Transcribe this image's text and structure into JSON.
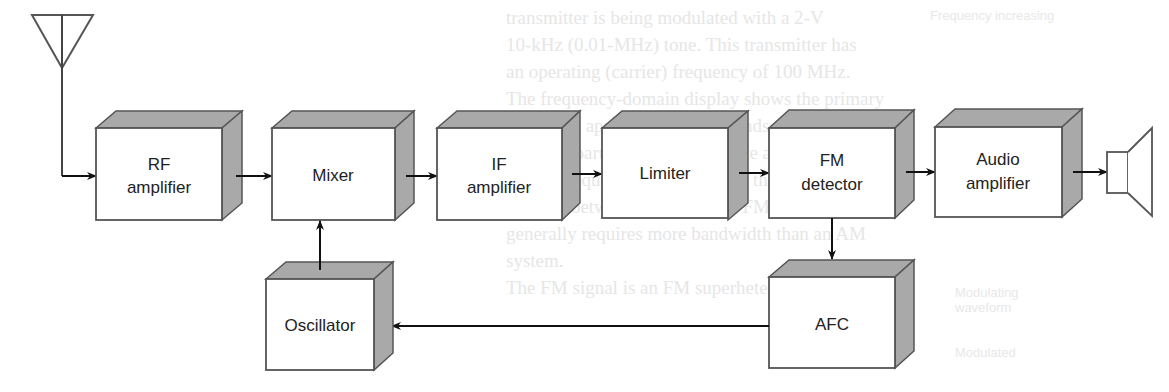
{
  "diagram": {
    "colors": {
      "box_face": "#ffffff",
      "box_shade": "#a9a9a9",
      "stroke": "#555555",
      "arrow": "#111111",
      "ghost_text": "#e6e6e6"
    },
    "blocks": [
      {
        "id": "rf",
        "line1": "RF",
        "line2": "amplifier"
      },
      {
        "id": "mix",
        "line1": "Mixer",
        "line2": ""
      },
      {
        "id": "if",
        "line1": "IF",
        "line2": "amplifier"
      },
      {
        "id": "lim",
        "line1": "Limiter",
        "line2": ""
      },
      {
        "id": "fm",
        "line1": "FM",
        "line2": "detector"
      },
      {
        "id": "aud",
        "line1": "Audio",
        "line2": "amplifier"
      },
      {
        "id": "osc",
        "line1": "Oscillator",
        "line2": ""
      },
      {
        "id": "afc",
        "line1": "AFC",
        "line2": ""
      }
    ],
    "connections": [
      "antenna -> RF amplifier",
      "RF amplifier -> Mixer",
      "Mixer -> IF amplifier",
      "IF amplifier -> Limiter",
      "Limiter -> FM detector",
      "FM detector -> Audio amplifier",
      "Audio amplifier -> speaker",
      "FM detector -> AFC",
      "AFC -> Oscillator",
      "Oscillator -> Mixer"
    ],
    "icons": {
      "input": "antenna-icon",
      "output": "speaker-icon"
    }
  },
  "background_bleed": {
    "text_lines": [
      "transmitter is being modulated with a 2-V",
      "10-kHz (0.01-MHz) tone. This transmitter has",
      "an operating (carrier) frequency of 100 MHz.",
      "The frequency-domain display shows the primary",
      "sidebands appear. These sidebands are spaced",
      "10 kHz apart. They appear above and below the",
      "carrier frequency. This is one of the major",
      "features between AM and FM. FM often",
      "generally requires more bandwidth than an AM",
      "system.",
      "The FM signal is an FM superhetero-"
    ],
    "labels": [
      "Frequency increasing",
      "Decreasing",
      "Frequency",
      "Modulating waveform",
      "Modulated"
    ]
  }
}
